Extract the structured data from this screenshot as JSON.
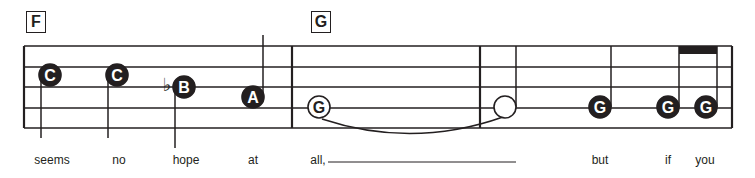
{
  "rehearsal_marks": [
    {
      "label": "F",
      "x": 26
    },
    {
      "label": "G",
      "x": 311
    }
  ],
  "staff": {
    "left": 24,
    "right": 732,
    "lines_y": [
      46,
      67,
      87,
      108,
      128
    ],
    "barlines_x": [
      24,
      292,
      480,
      732
    ],
    "color": "#231f20"
  },
  "notes": [
    {
      "letter": "C",
      "x": 50,
      "y": 75,
      "filled": true,
      "stem": "down",
      "stem_x": 41,
      "stem_to": 138
    },
    {
      "letter": "C",
      "x": 117,
      "y": 75,
      "filled": true,
      "stem": "down",
      "stem_x": 108,
      "stem_to": 138
    },
    {
      "letter": "B",
      "x": 184,
      "y": 87,
      "filled": true,
      "stem": "down",
      "stem_x": 175,
      "stem_to": 148,
      "accidental": "♭"
    },
    {
      "letter": "A",
      "x": 253,
      "y": 97,
      "filled": true,
      "stem": "up",
      "stem_x": 263,
      "stem_to": 35
    },
    {
      "letter": "G",
      "x": 319,
      "y": 107,
      "filled": false,
      "stem": "none"
    },
    {
      "letter": "",
      "x": 505,
      "y": 107,
      "filled": false,
      "stem": "up",
      "stem_x": 516,
      "stem_to": 46
    },
    {
      "letter": "G",
      "x": 600,
      "y": 107,
      "filled": true,
      "stem": "up",
      "stem_x": 611,
      "stem_to": 46
    },
    {
      "letter": "G",
      "x": 668,
      "y": 107,
      "filled": true,
      "stem": "up",
      "stem_x": 679,
      "stem_to": 46
    },
    {
      "letter": "G",
      "x": 706,
      "y": 107,
      "filled": true,
      "stem": "up",
      "stem_x": 717,
      "stem_to": 46
    }
  ],
  "beam": {
    "x1": 679,
    "x2": 717,
    "y": 46,
    "height": 8
  },
  "tie": {
    "from_x": 322,
    "to_x": 503,
    "y": 119
  },
  "lyrics": [
    {
      "text": "seems",
      "x": 52
    },
    {
      "text": "no",
      "x": 119
    },
    {
      "text": "hope",
      "x": 186
    },
    {
      "text": "at",
      "x": 253
    },
    {
      "text": "all,",
      "x": 318
    },
    {
      "text": "but",
      "x": 600
    },
    {
      "text": "if",
      "x": 668
    },
    {
      "text": "you",
      "x": 705
    }
  ],
  "extender": {
    "x1": 328,
    "x2": 516,
    "y": 162
  }
}
